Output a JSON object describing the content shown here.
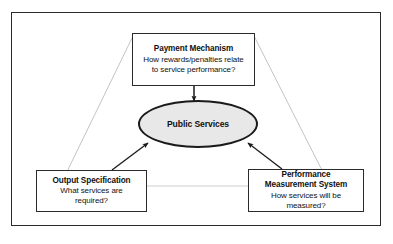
{
  "diagram": {
    "frame": {
      "border_color": "#2b2b2b"
    },
    "center_node": {
      "label": "Public Services",
      "shape": "ellipse",
      "fill_color": "#e8e8e8",
      "border_color": "#1a1a1a"
    },
    "nodes": [
      {
        "id": "payment-mechanism",
        "title": "Payment Mechanism",
        "lines": [
          "How rewards/penalties relate",
          "to service performance?"
        ],
        "title_lines": [
          "Payment Mechanism"
        ]
      },
      {
        "id": "output-specification",
        "title": "Output Specification",
        "lines": [
          "What services are",
          "required?"
        ],
        "title_lines": [
          "Output Specification"
        ]
      },
      {
        "id": "performance-measurement-system",
        "title": "Performance Measurement System",
        "lines": [
          "How services will be",
          "measured?"
        ],
        "title_lines": [
          "Performance",
          "Measurement System"
        ]
      }
    ],
    "connectors": [
      {
        "from": "payment-mechanism",
        "to": "public-services",
        "style": "solid-arrow",
        "color": "#1a1a1a"
      },
      {
        "from": "output-specification",
        "to": "public-services",
        "style": "solid-arrow",
        "color": "#1a1a1a"
      },
      {
        "from": "performance-measurement-system",
        "to": "public-services",
        "style": "solid-arrow",
        "color": "#1a1a1a"
      },
      {
        "from": "payment-mechanism",
        "to": "output-specification",
        "style": "thin-line",
        "color": "#b8b8b8"
      },
      {
        "from": "payment-mechanism",
        "to": "performance-measurement-system",
        "style": "thin-line",
        "color": "#b8b8b8"
      },
      {
        "from": "output-specification",
        "to": "performance-measurement-system",
        "style": "thin-line",
        "color": "#c4c4c4"
      }
    ]
  }
}
